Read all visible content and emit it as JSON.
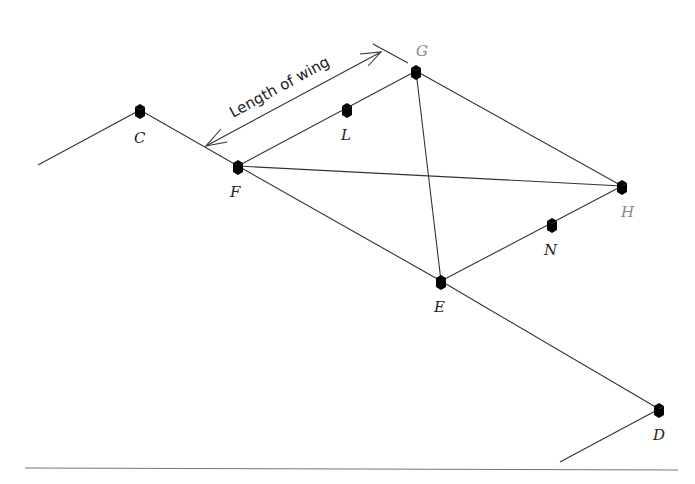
{
  "diagram": {
    "type": "pegged layout plan",
    "dimension_label": "Length of wing",
    "points": {
      "C": {
        "label": "C",
        "x": 140,
        "y": 112
      },
      "F": {
        "label": "F",
        "x": 238,
        "y": 167
      },
      "L": {
        "label": "L",
        "x": 347,
        "y": 111
      },
      "G": {
        "label": "G",
        "x": 416,
        "y": 73
      },
      "H": {
        "label": "H",
        "x": 622,
        "y": 188
      },
      "N": {
        "label": "N",
        "x": 552,
        "y": 226
      },
      "E": {
        "label": "E",
        "x": 441,
        "y": 282
      },
      "D": {
        "label": "D",
        "x": 659,
        "y": 411
      }
    },
    "edges": [
      [
        "start",
        "C"
      ],
      [
        "C",
        "F"
      ],
      [
        "F",
        "E"
      ],
      [
        "E",
        "D"
      ],
      [
        "D",
        "end"
      ],
      [
        "F",
        "L"
      ],
      [
        "L",
        "G"
      ],
      [
        "G",
        "H"
      ],
      [
        "H",
        "N"
      ],
      [
        "N",
        "E"
      ],
      [
        "F",
        "H"
      ],
      [
        "G",
        "E"
      ]
    ],
    "colors": {
      "line": "#333333",
      "label": "#222222",
      "label_muted": "#888888"
    }
  }
}
